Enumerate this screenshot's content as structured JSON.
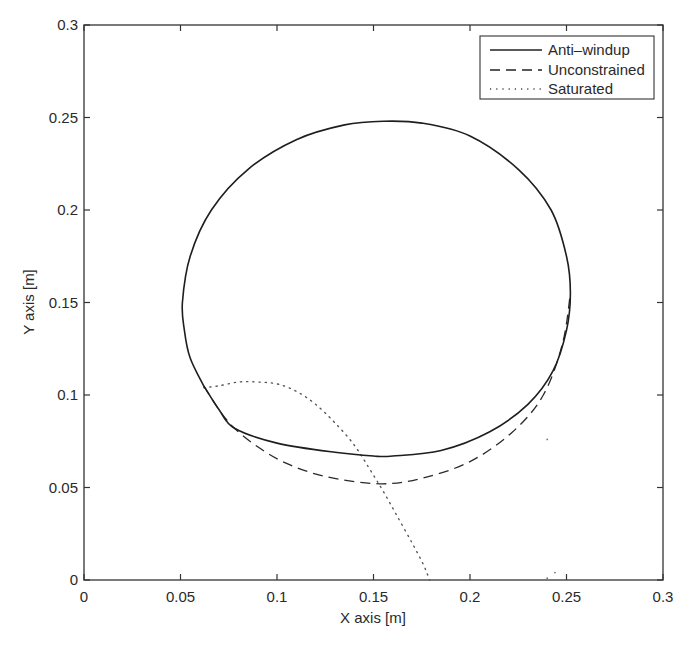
{
  "chart_data": {
    "type": "line",
    "title": "",
    "xlabel": "X axis [m]",
    "ylabel": "Y axis [m]",
    "xlim": [
      0,
      0.3
    ],
    "ylim": [
      0,
      0.3
    ],
    "xticks": [
      "0",
      "0.05",
      "0.1",
      "0.15",
      "0.2",
      "0.25",
      "0.3"
    ],
    "yticks": [
      "0",
      "0.05",
      "0.1",
      "0.15",
      "0.2",
      "0.25",
      "0.3"
    ],
    "grid": false,
    "legend_position": "upper right",
    "series": [
      {
        "name": "Anti-windup",
        "style": "solid",
        "x": [
          0.062,
          0.055,
          0.052,
          0.051,
          0.055,
          0.066,
          0.085,
          0.11,
          0.135,
          0.155,
          0.175,
          0.2,
          0.225,
          0.242,
          0.25,
          0.252,
          0.25,
          0.243,
          0.23,
          0.21,
          0.185,
          0.16,
          0.15,
          0.13,
          0.1,
          0.078,
          0.07,
          0.062
        ],
        "y": [
          0.105,
          0.12,
          0.135,
          0.15,
          0.175,
          0.2,
          0.222,
          0.238,
          0.246,
          0.248,
          0.247,
          0.24,
          0.222,
          0.2,
          0.175,
          0.155,
          0.135,
          0.113,
          0.095,
          0.08,
          0.07,
          0.067,
          0.067,
          0.069,
          0.074,
          0.082,
          0.092,
          0.105
        ]
      },
      {
        "name": "Unconstrained",
        "style": "dashed",
        "x": [
          0.062,
          0.07,
          0.078,
          0.09,
          0.105,
          0.125,
          0.153,
          0.175,
          0.2,
          0.222,
          0.238,
          0.248,
          0.252
        ],
        "y": [
          0.105,
          0.092,
          0.082,
          0.072,
          0.063,
          0.056,
          0.052,
          0.055,
          0.064,
          0.08,
          0.1,
          0.128,
          0.155
        ]
      },
      {
        "name": "Saturated",
        "style": "dotted",
        "x": [
          0.062,
          0.07,
          0.08,
          0.09,
          0.1,
          0.11,
          0.12,
          0.13,
          0.14,
          0.148,
          0.155,
          0.162,
          0.17,
          0.176,
          0.179
        ],
        "y": [
          0.104,
          0.105,
          0.107,
          0.107,
          0.106,
          0.102,
          0.095,
          0.085,
          0.073,
          0.06,
          0.048,
          0.035,
          0.02,
          0.008,
          0.0
        ]
      }
    ]
  },
  "legend": {
    "items": [
      {
        "label": "Anti–windup",
        "style": "solid"
      },
      {
        "label": "Unconstrained",
        "style": "dashed"
      },
      {
        "label": "Saturated",
        "style": "dotted"
      }
    ]
  }
}
